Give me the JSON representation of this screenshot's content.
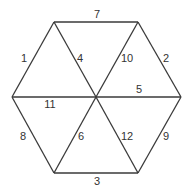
{
  "diagram": {
    "type": "hexagon-triangulation",
    "stroke_color": "#3a3a3a",
    "text_color": "#333333",
    "vertices": {
      "top_left": [
        54,
        22
      ],
      "top_right": [
        138,
        22
      ],
      "left": [
        12,
        97
      ],
      "center": [
        96,
        97
      ],
      "right": [
        181,
        97
      ],
      "bottom_left": [
        54,
        173
      ],
      "bottom_right": [
        138,
        173
      ]
    },
    "edges": [
      {
        "label": "7",
        "from": "top_left",
        "to": "top_right",
        "label_pos": [
          97,
          15
        ]
      },
      {
        "label": "1",
        "from": "left",
        "to": "top_left",
        "label_pos": [
          24,
          59
        ]
      },
      {
        "label": "4",
        "from": "top_left",
        "to": "center",
        "label_pos": [
          80,
          59
        ]
      },
      {
        "label": "10",
        "from": "center",
        "to": "top_right",
        "label_pos": [
          127,
          59
        ]
      },
      {
        "label": "2",
        "from": "top_right",
        "to": "right",
        "label_pos": [
          166,
          59
        ]
      },
      {
        "label": "11",
        "from": "left",
        "to": "center",
        "label_pos": [
          50,
          105
        ]
      },
      {
        "label": "5",
        "from": "center",
        "to": "right",
        "label_pos": [
          139,
          90
        ]
      },
      {
        "label": "8",
        "from": "left",
        "to": "bottom_left",
        "label_pos": [
          23,
          137
        ]
      },
      {
        "label": "6",
        "from": "bottom_left",
        "to": "center",
        "label_pos": [
          81,
          137
        ]
      },
      {
        "label": "12",
        "from": "center",
        "to": "bottom_right",
        "label_pos": [
          127,
          137
        ]
      },
      {
        "label": "9",
        "from": "bottom_right",
        "to": "right",
        "label_pos": [
          166,
          137
        ]
      },
      {
        "label": "3",
        "from": "bottom_left",
        "to": "bottom_right",
        "label_pos": [
          97,
          182
        ]
      }
    ]
  }
}
